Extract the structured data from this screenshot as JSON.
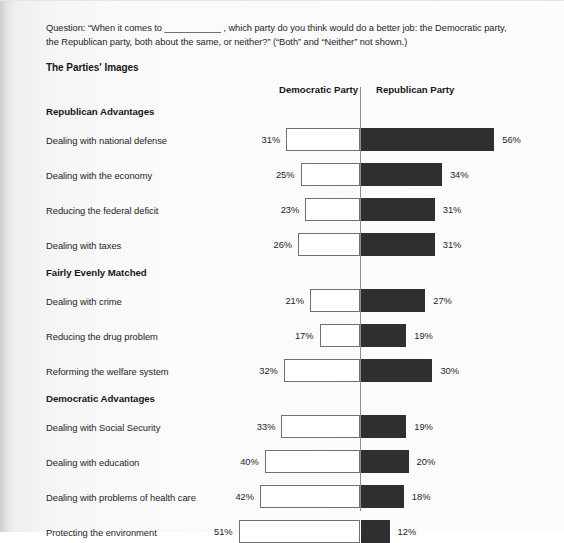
{
  "question": "Question: “When it comes to ___________ , which party do you think would do a better job: the Democratic party, the Republican party, both about the same, or neither?” (“Both” and “Neither” not shown.)",
  "section_title": "The Parties' Images",
  "columns": {
    "democratic": "Democratic Party",
    "republican": "Republican Party"
  },
  "colors": {
    "democratic_bar": "#ffffff",
    "democratic_bar_border": "#707070",
    "republican_bar": "#2f2f2f",
    "axis": "#8d8d8d",
    "text": "#1d1e23"
  },
  "chart_data": {
    "type": "bar",
    "title": "The Parties' Images",
    "subtitle": "Question: “When it comes to ___________ , which party do you think would do a better job: the Democratic party, the Republican party, both about the same, or neither?” (“Both” and “Neither” not shown.)",
    "orientation": "horizontal",
    "style": "diverging-bidirectional",
    "xlabel": "",
    "ylabel": "",
    "unit": "%",
    "grid": false,
    "legend_position": "top",
    "series": [
      {
        "name": "Democratic Party",
        "side": "left",
        "color": "#ffffff"
      },
      {
        "name": "Republican Party",
        "side": "right",
        "color": "#2f2f2f"
      }
    ],
    "groups": [
      {
        "heading": "Republican Advantages",
        "rows": [
          {
            "category": "Dealing with national defense",
            "democratic": 31,
            "republican": 56,
            "democratic_label": "31%",
            "republican_label": "56%"
          },
          {
            "category": "Dealing with the economy",
            "democratic": 25,
            "republican": 34,
            "democratic_label": "25%",
            "republican_label": "34%"
          },
          {
            "category": "Reducing the federal deficit",
            "democratic": 23,
            "republican": 31,
            "democratic_label": "23%",
            "republican_label": "31%"
          },
          {
            "category": "Dealing with taxes",
            "democratic": 26,
            "republican": 31,
            "democratic_label": "26%",
            "republican_label": "31%"
          }
        ]
      },
      {
        "heading": "Fairly Evenly Matched",
        "rows": [
          {
            "category": "Dealing with crime",
            "democratic": 21,
            "republican": 27,
            "democratic_label": "21%",
            "republican_label": "27%"
          },
          {
            "category": "Reducing the drug problem",
            "democratic": 17,
            "republican": 19,
            "democratic_label": "17%",
            "republican_label": "19%"
          },
          {
            "category": "Reforming the welfare system",
            "democratic": 32,
            "republican": 30,
            "democratic_label": "32%",
            "republican_label": "30%"
          }
        ]
      },
      {
        "heading": "Democratic Advantages",
        "rows": [
          {
            "category": "Dealing with Social Security",
            "democratic": 33,
            "republican": 19,
            "democratic_label": "33%",
            "republican_label": "19%"
          },
          {
            "category": "Dealing with education",
            "democratic": 40,
            "republican": 20,
            "democratic_label": "40%",
            "republican_label": "20%"
          },
          {
            "category": "Dealing with problems of health care",
            "democratic": 42,
            "republican": 18,
            "democratic_label": "42%",
            "republican_label": "18%"
          },
          {
            "category": "Protecting the environment",
            "democratic": 51,
            "republican": 12,
            "democratic_label": "51%",
            "republican_label": "12%"
          }
        ]
      }
    ]
  }
}
